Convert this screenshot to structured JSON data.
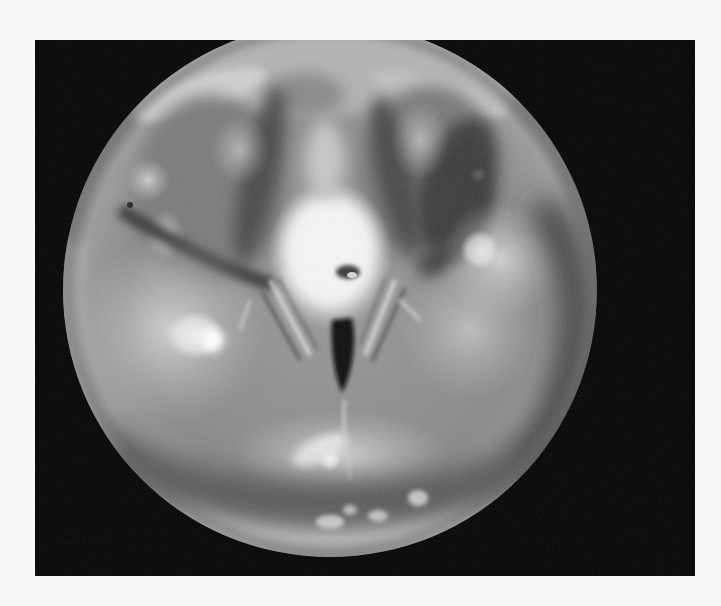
{
  "image": {
    "kind": "endoscopic-photograph",
    "view": "laryngoscopy",
    "color_mode": "grayscale",
    "background_color": "#f7f7f7",
    "frame": {
      "x": 35,
      "y": 40,
      "width": 660,
      "height": 536,
      "color": "#050505"
    },
    "scope_field": {
      "cx": 330,
      "cy": 290,
      "r": 267
    }
  }
}
